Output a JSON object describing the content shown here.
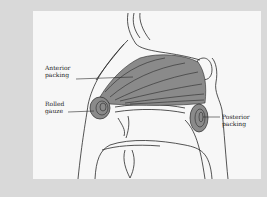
{
  "figure": {
    "type": "anatomical-illustration",
    "colors": {
      "background": "#d9d9d9",
      "panel": "#f7f7f7",
      "packing_fill": "#8a8a8a",
      "line": "#2a2a2a"
    }
  },
  "labels": {
    "anterior": "Anterior\npacking",
    "rolled": "Rolled\ngauze",
    "posterior": "Posterior\npacking"
  }
}
